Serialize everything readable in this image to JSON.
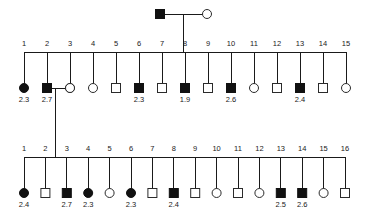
{
  "figure": {
    "type": "pedigree-chart",
    "width": 366,
    "height": 223,
    "background": "#ffffff",
    "line_color": "#1a1a1a",
    "filled_color": "#111111",
    "open_color": "#ffffff"
  },
  "founders": {
    "father": {
      "sex": "male",
      "affected": true,
      "symbol": "filled-square",
      "value": ""
    },
    "mother": {
      "sex": "female",
      "affected": false,
      "symbol": "open-circle",
      "value": ""
    }
  },
  "generations": [
    {
      "name": "generation-1",
      "count": 15,
      "members": [
        {
          "index": "1",
          "sex": "female",
          "affected": true,
          "symbol": "filled-circle",
          "value": "2.3"
        },
        {
          "index": "2",
          "sex": "male",
          "affected": true,
          "symbol": "filled-square",
          "value": "2.7"
        },
        {
          "index": "3",
          "sex": "female",
          "affected": true,
          "symbol": "filled-circle",
          "value": ""
        },
        {
          "index": "4",
          "sex": "female",
          "affected": false,
          "symbol": "open-circle",
          "value": ""
        },
        {
          "index": "5",
          "sex": "male",
          "affected": false,
          "symbol": "open-square",
          "value": ""
        },
        {
          "index": "6",
          "sex": "male",
          "affected": true,
          "symbol": "filled-square",
          "value": "2.3"
        },
        {
          "index": "7",
          "sex": "male",
          "affected": false,
          "symbol": "open-square",
          "value": ""
        },
        {
          "index": "8",
          "sex": "male",
          "affected": true,
          "symbol": "filled-square",
          "value": "1.9"
        },
        {
          "index": "9",
          "sex": "male",
          "affected": false,
          "symbol": "open-square",
          "value": ""
        },
        {
          "index": "10",
          "sex": "male",
          "affected": true,
          "symbol": "filled-square",
          "value": "2.6"
        },
        {
          "index": "11",
          "sex": "female",
          "affected": false,
          "symbol": "open-circle",
          "value": ""
        },
        {
          "index": "12",
          "sex": "male",
          "affected": false,
          "symbol": "open-square",
          "value": ""
        },
        {
          "index": "13",
          "sex": "male",
          "affected": true,
          "symbol": "filled-square",
          "value": "2.4"
        },
        {
          "index": "14",
          "sex": "male",
          "affected": false,
          "symbol": "open-square",
          "value": ""
        },
        {
          "index": "15",
          "sex": "female",
          "affected": false,
          "symbol": "open-circle",
          "value": ""
        }
      ],
      "spouse": {
        "sex": "female",
        "affected": false,
        "symbol": "open-circle",
        "value": "",
        "married_to_index": "2"
      }
    },
    {
      "name": "generation-2",
      "count": 16,
      "members": [
        {
          "index": "1",
          "sex": "female",
          "affected": true,
          "symbol": "filled-circle",
          "value": "2.4"
        },
        {
          "index": "2",
          "sex": "male",
          "affected": false,
          "symbol": "open-square",
          "value": ""
        },
        {
          "index": "3",
          "sex": "male",
          "affected": true,
          "symbol": "filled-square",
          "value": "2.7"
        },
        {
          "index": "4",
          "sex": "female",
          "affected": true,
          "symbol": "filled-circle",
          "value": "2.3"
        },
        {
          "index": "5",
          "sex": "female",
          "affected": false,
          "symbol": "open-circle",
          "value": ""
        },
        {
          "index": "6",
          "sex": "female",
          "affected": true,
          "symbol": "filled-circle",
          "value": "2.3"
        },
        {
          "index": "7",
          "sex": "male",
          "affected": false,
          "symbol": "open-square",
          "value": ""
        },
        {
          "index": "8",
          "sex": "male",
          "affected": true,
          "symbol": "filled-square",
          "value": "2.4"
        },
        {
          "index": "9",
          "sex": "male",
          "affected": false,
          "symbol": "open-square",
          "value": ""
        },
        {
          "index": "10",
          "sex": "female",
          "affected": false,
          "symbol": "open-circle",
          "value": ""
        },
        {
          "index": "11",
          "sex": "male",
          "affected": false,
          "symbol": "open-square",
          "value": ""
        },
        {
          "index": "12",
          "sex": "female",
          "affected": false,
          "symbol": "open-circle",
          "value": ""
        },
        {
          "index": "13",
          "sex": "male",
          "affected": true,
          "symbol": "filled-square",
          "value": "2.5"
        },
        {
          "index": "14",
          "sex": "male",
          "affected": true,
          "symbol": "filled-square",
          "value": "2.6"
        },
        {
          "index": "15",
          "sex": "female",
          "affected": false,
          "symbol": "open-circle",
          "value": ""
        },
        {
          "index": "16",
          "sex": "male",
          "affected": false,
          "symbol": "open-square",
          "value": ""
        }
      ]
    }
  ],
  "layout": {
    "founder_row_y": 14,
    "founder_father_x": 160,
    "founder_mother_x": 207,
    "founder_descent_x": 183,
    "gen1_sibline_y": 52,
    "gen1_symbol_y": 88,
    "gen1_index_y": 46,
    "gen1_value_y": 102,
    "gen1_start_x": 24,
    "gen1_step_x": 23,
    "gen1_spouse_x": 70,
    "gen2_descent_x": 55,
    "gen2_sibline_y": 157,
    "gen2_symbol_y": 193,
    "gen2_index_y": 151,
    "gen2_value_y": 207,
    "gen2_start_x": 24,
    "gen2_step_x": 21.4,
    "symbol_size": 9
  }
}
